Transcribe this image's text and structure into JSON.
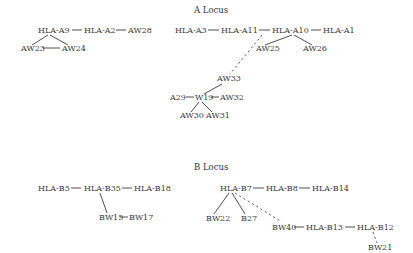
{
  "sections": {
    "a_locus": {
      "title": "A Locus",
      "x": 194,
      "y": 13
    },
    "b_locus": {
      "title": "B Locus",
      "x": 194,
      "y": 170
    }
  },
  "nodes": [
    {
      "id": "HLA-A9",
      "label": "HLA-A9",
      "x": 38,
      "y": 33
    },
    {
      "id": "HLA-A2",
      "label": "HLA-A2",
      "x": 84,
      "y": 33
    },
    {
      "id": "AW28",
      "label": "AW28",
      "x": 128,
      "y": 33
    },
    {
      "id": "AW23",
      "label": "AW23",
      "x": 21,
      "y": 51
    },
    {
      "id": "AW24",
      "label": "AW24",
      "x": 62,
      "y": 51
    },
    {
      "id": "HLA-A3",
      "label": "HLA-A3",
      "x": 175,
      "y": 33
    },
    {
      "id": "HLA-A11",
      "label": "HLA-A11",
      "x": 221,
      "y": 33
    },
    {
      "id": "HLA-A10",
      "label": "HLA-A10",
      "x": 272,
      "y": 33
    },
    {
      "id": "HLA-A1",
      "label": "HLA-A1",
      "x": 323,
      "y": 33
    },
    {
      "id": "AW25",
      "label": "AW25",
      "x": 256,
      "y": 51
    },
    {
      "id": "AW26",
      "label": "AW26",
      "x": 303,
      "y": 51
    },
    {
      "id": "AW33",
      "label": "AW33",
      "x": 217,
      "y": 81
    },
    {
      "id": "A29",
      "label": "A29",
      "x": 170,
      "y": 100
    },
    {
      "id": "W19",
      "label": "W19",
      "x": 195,
      "y": 100
    },
    {
      "id": "AW32",
      "label": "AW32",
      "x": 220,
      "y": 100
    },
    {
      "id": "AW30",
      "label": "AW30",
      "x": 180,
      "y": 118
    },
    {
      "id": "AW31",
      "label": "AW31",
      "x": 206,
      "y": 118
    },
    {
      "id": "HLA-B5",
      "label": "HLA-B5",
      "x": 38,
      "y": 191
    },
    {
      "id": "HLA-B35",
      "label": "HLA-B35",
      "x": 84,
      "y": 191
    },
    {
      "id": "HLA-B18",
      "label": "HLA-B18",
      "x": 134,
      "y": 191
    },
    {
      "id": "BW15",
      "label": "BW15",
      "x": 99,
      "y": 220
    },
    {
      "id": "BW17",
      "label": "BW17",
      "x": 129,
      "y": 220
    },
    {
      "id": "HLA-B7",
      "label": "HLA-B7",
      "x": 220,
      "y": 191
    },
    {
      "id": "HLA-B8",
      "label": "HLA-B8",
      "x": 266,
      "y": 191
    },
    {
      "id": "HLA-B14",
      "label": "HLA-B14",
      "x": 312,
      "y": 191
    },
    {
      "id": "BW22",
      "label": "BW22",
      "x": 206,
      "y": 221
    },
    {
      "id": "B27",
      "label": "B27",
      "x": 241,
      "y": 221
    },
    {
      "id": "BW40",
      "label": "BW40",
      "x": 272,
      "y": 230
    },
    {
      "id": "HLA-B13",
      "label": "HLA-B13",
      "x": 306,
      "y": 230
    },
    {
      "id": "HLA-B12",
      "label": "HLA-B12",
      "x": 357,
      "y": 230
    },
    {
      "id": "BW21",
      "label": "BW21",
      "x": 368,
      "y": 250
    }
  ],
  "edges": [
    {
      "from": "HLA-A9",
      "to": "HLA-A2",
      "x1": 72,
      "y1": 30,
      "x2": 82,
      "y2": 30,
      "style": "solid"
    },
    {
      "from": "HLA-A2",
      "to": "AW28",
      "x1": 116,
      "y1": 30,
      "x2": 126,
      "y2": 30,
      "style": "solid"
    },
    {
      "from": "HLA-A9",
      "to": "AW23",
      "x1": 48,
      "y1": 35,
      "x2": 32,
      "y2": 45,
      "style": "solid"
    },
    {
      "from": "HLA-A9",
      "to": "AW24",
      "x1": 50,
      "y1": 35,
      "x2": 68,
      "y2": 45,
      "style": "solid"
    },
    {
      "from": "AW23",
      "to": "AW24",
      "x1": 43,
      "y1": 48,
      "x2": 60,
      "y2": 48,
      "style": "solid"
    },
    {
      "from": "HLA-A3",
      "to": "HLA-A11",
      "x1": 208,
      "y1": 30,
      "x2": 219,
      "y2": 30,
      "style": "solid"
    },
    {
      "from": "HLA-A11",
      "to": "HLA-A10",
      "x1": 259,
      "y1": 30,
      "x2": 270,
      "y2": 30,
      "style": "solid"
    },
    {
      "from": "HLA-A10",
      "to": "HLA-A1",
      "x1": 311,
      "y1": 30,
      "x2": 321,
      "y2": 30,
      "style": "solid"
    },
    {
      "from": "HLA-A10",
      "to": "AW25",
      "x1": 292,
      "y1": 35,
      "x2": 265,
      "y2": 45,
      "style": "solid"
    },
    {
      "from": "HLA-A10",
      "to": "AW26",
      "x1": 294,
      "y1": 35,
      "x2": 312,
      "y2": 45,
      "style": "solid"
    },
    {
      "from": "HLA-A11",
      "to": "AW33",
      "x1": 262,
      "y1": 35,
      "x2": 230,
      "y2": 74,
      "style": "dashed"
    },
    {
      "from": "AW33",
      "to": "W19",
      "x1": 222,
      "y1": 84,
      "x2": 204,
      "y2": 94,
      "style": "solid"
    },
    {
      "from": "A29",
      "to": "W19",
      "x1": 186,
      "y1": 97,
      "x2": 194,
      "y2": 97,
      "style": "solid"
    },
    {
      "from": "W19",
      "to": "AW32",
      "x1": 211,
      "y1": 97,
      "x2": 219,
      "y2": 97,
      "style": "solid"
    },
    {
      "from": "W19",
      "to": "AW30",
      "x1": 199,
      "y1": 102,
      "x2": 191,
      "y2": 112,
      "style": "solid"
    },
    {
      "from": "W19",
      "to": "AW31",
      "x1": 202,
      "y1": 102,
      "x2": 212,
      "y2": 112,
      "style": "solid"
    },
    {
      "from": "HLA-B5",
      "to": "HLA-B35",
      "x1": 71,
      "y1": 188,
      "x2": 81,
      "y2": 188,
      "style": "solid"
    },
    {
      "from": "HLA-B35",
      "to": "HLA-B18",
      "x1": 122,
      "y1": 188,
      "x2": 132,
      "y2": 188,
      "style": "solid"
    },
    {
      "from": "HLA-B35",
      "to": "BW15",
      "x1": 100,
      "y1": 193,
      "x2": 107,
      "y2": 213,
      "style": "solid"
    },
    {
      "from": "BW15",
      "to": "BW17",
      "x1": 120,
      "y1": 217,
      "x2": 128,
      "y2": 217,
      "style": "solid"
    },
    {
      "from": "HLA-B7",
      "to": "HLA-B8",
      "x1": 253,
      "y1": 188,
      "x2": 264,
      "y2": 188,
      "style": "solid"
    },
    {
      "from": "HLA-B8",
      "to": "HLA-B14",
      "x1": 299,
      "y1": 188,
      "x2": 310,
      "y2": 188,
      "style": "solid"
    },
    {
      "from": "HLA-B7",
      "to": "BW22",
      "x1": 229,
      "y1": 193,
      "x2": 214,
      "y2": 214,
      "style": "solid"
    },
    {
      "from": "HLA-B7",
      "to": "B27",
      "x1": 232,
      "y1": 193,
      "x2": 245,
      "y2": 214,
      "style": "solid"
    },
    {
      "from": "HLA-B7",
      "to": "BW40",
      "x1": 235,
      "y1": 193,
      "x2": 282,
      "y2": 222,
      "style": "dashed"
    },
    {
      "from": "BW40",
      "to": "HLA-B13",
      "x1": 294,
      "y1": 227,
      "x2": 304,
      "y2": 227,
      "style": "solid"
    },
    {
      "from": "HLA-B13",
      "to": "HLA-B12",
      "x1": 345,
      "y1": 227,
      "x2": 355,
      "y2": 227,
      "style": "solid"
    },
    {
      "from": "HLA-B12",
      "to": "BW21",
      "x1": 373,
      "y1": 232,
      "x2": 377,
      "y2": 243,
      "style": "dashed"
    }
  ]
}
